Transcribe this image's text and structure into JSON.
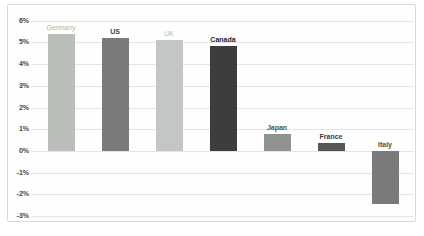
{
  "chart_data": {
    "type": "bar",
    "title": "",
    "xlabel": "",
    "ylabel": "",
    "categories": [
      "Germany",
      "US",
      "UK",
      "Canada",
      "Japan",
      "France",
      "Italy"
    ],
    "values": [
      5.4,
      5.2,
      5.1,
      4.85,
      0.8,
      0.35,
      -2.45
    ],
    "bar_colors": [
      "#b9beb9",
      "#7b7b7b",
      "#c3c7c3",
      "#3d3d3d",
      "#8e938e",
      "#575757",
      "#7a7a7a"
    ],
    "label_colors": [
      "#aeb3ae",
      "#424242",
      "#b5b9b5",
      "#1f1f1f",
      "#535353",
      "#3b3b3b",
      "#4e4e4e"
    ],
    "label_bold": [
      false,
      true,
      false,
      true,
      true,
      true,
      true
    ],
    "ylim": [
      -3,
      6
    ],
    "ytick_labels": [
      "6%",
      "5%",
      "4%",
      "3%",
      "2%",
      "1%",
      "0%",
      "-1%",
      "-2%",
      "-3%"
    ],
    "ytick_values": [
      6,
      5,
      4,
      3,
      2,
      1,
      0,
      -1,
      -2,
      -3
    ],
    "grid": true,
    "legend_position": "none",
    "data_labels": "category-name-above-bar"
  }
}
